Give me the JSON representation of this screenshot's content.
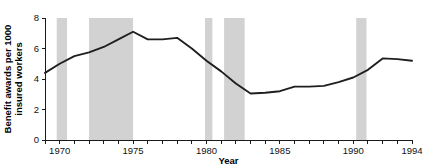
{
  "chart_data": {
    "type": "line",
    "title": "",
    "xlabel": "Year",
    "ylabel": "Benefit awards per 1000 insured workers",
    "ylabel_line1": "Benefit awards per 1000",
    "ylabel_line2": "insured workers",
    "xlim": [
      1969,
      1994
    ],
    "ylim": [
      0,
      8
    ],
    "yticks": [
      0,
      2,
      4,
      6,
      8
    ],
    "ytick_labels": [
      "0",
      "2",
      "4",
      "6",
      "8"
    ],
    "xticks": [
      1969,
      1970,
      1971,
      1972,
      1973,
      1974,
      1975,
      1976,
      1977,
      1978,
      1979,
      1980,
      1981,
      1982,
      1983,
      1984,
      1985,
      1986,
      1987,
      1988,
      1989,
      1990,
      1991,
      1992,
      1993,
      1994
    ],
    "xtick_labels_shown": [
      "1970",
      "1975",
      "1980",
      "1985",
      "1990",
      "1994"
    ],
    "xtick_labels_shown_at": [
      1970,
      1975,
      1980,
      1985,
      1990,
      1994
    ],
    "grid": false,
    "legend": "none",
    "line_color": "#1f1f1f",
    "band_color": "#d2d2d2",
    "x": [
      1969,
      1970,
      1971,
      1972,
      1973,
      1974,
      1975,
      1976,
      1977,
      1978,
      1979,
      1980,
      1981,
      1982,
      1983,
      1984,
      1985,
      1986,
      1987,
      1988,
      1989,
      1990,
      1991,
      1992,
      1993,
      1994
    ],
    "values": [
      4.4,
      5.0,
      5.5,
      5.75,
      6.1,
      6.6,
      7.1,
      6.6,
      6.6,
      6.7,
      6.0,
      5.2,
      4.5,
      3.7,
      3.05,
      3.1,
      3.2,
      3.5,
      3.5,
      3.55,
      3.8,
      4.1,
      4.6,
      5.35,
      5.3,
      5.2
    ],
    "recession_bands": [
      {
        "start": 1969.8,
        "end": 1970.5,
        "label": "1969-1970 recession"
      },
      {
        "start": 1972.0,
        "end": 1975.0,
        "label": "1973-1975 recession"
      },
      {
        "start": 1979.9,
        "end": 1980.4,
        "label": "1980 recession"
      },
      {
        "start": 1981.2,
        "end": 1982.6,
        "label": "1981-1982 recession"
      },
      {
        "start": 1990.2,
        "end": 1990.9,
        "label": "1990-1991 recession"
      }
    ]
  }
}
